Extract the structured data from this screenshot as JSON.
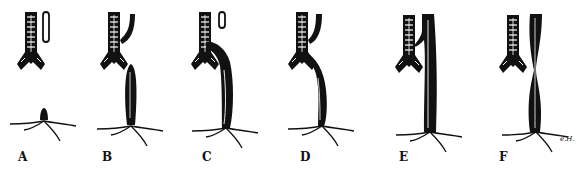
{
  "figure": {
    "panels": [
      {
        "id": "A",
        "label": "A",
        "x": 18
      },
      {
        "id": "B",
        "label": "B",
        "x": 102
      },
      {
        "id": "C",
        "label": "C",
        "x": 202
      },
      {
        "id": "D",
        "label": "D",
        "x": 300
      },
      {
        "id": "E",
        "label": "E",
        "x": 399
      },
      {
        "id": "F",
        "label": "F",
        "x": 499
      }
    ],
    "signature": "e.H."
  },
  "colors": {
    "ink": "#111111",
    "paper": "#ffffff"
  }
}
